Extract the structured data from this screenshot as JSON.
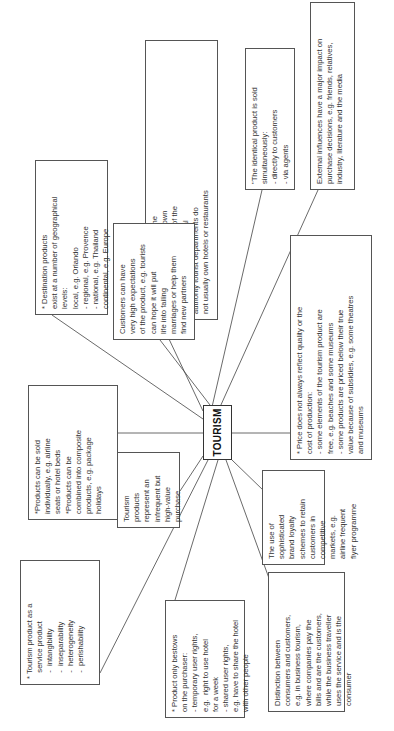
{
  "diagram": {
    "center": {
      "label": "TOURISM"
    },
    "nodes": [
      {
        "id": "organizations",
        "text": "*Organizations marketing the\ndestination product do not own\nor control all the elements of the\nproduct.  For example, local\nauthority tourist departments do\nnot usually own hotels or restaurants"
      },
      {
        "id": "identical-product",
        "text": "\"The identical product is sold\nsimultaneously:\n- directly to customers\n- via agents"
      },
      {
        "id": "external-influences",
        "text": "External influences have a major impact on\npurchase decisions, e.g. friends, relatives,\nindustry, literature and the media"
      },
      {
        "id": "destination-products",
        "text": "* Destination products\nexist at a number of geographical\nlevels:\nlocal, e.g. Orlando\n- regional, e.g. Provence\n- national, e.g. Thailand\ncontinental, e.g. Europe"
      },
      {
        "id": "high-expectations",
        "text": "Customers can have\nvery high expectations\nof the product, e.g. tourists\ncan hope it will put\nlife into failing\nmarriages or help them\nfind new partners"
      },
      {
        "id": "price",
        "text": "* Price does not always reflect quality or the\ncost of production:\n- some elements of the tourism product are\nfree, e.g. beaches and some museums\n- some products are priced below their true\nvalue because of subsidies, e.g. some theatres\nand museums"
      },
      {
        "id": "products-sold",
        "text": "*Products can be sold\nindividually, e.g. airline\nseats or hotel beds\n*Products can be\ncombined into composite\nproducts, e.g. package\nholidays"
      },
      {
        "id": "infrequent-purchase",
        "text": "Tourism\nproducts\nrepresent an\ninfrequent but\nhigh-value\npurchase"
      },
      {
        "id": "brand-loyalty",
        "text": "The use of\nsophisticated\nbrand loyalty\nschemes to retain\ncustomers in\ncompetitive\nmarkets, e.g.\nairline frequent\nflyer programme"
      },
      {
        "id": "service-product",
        "text": "* Tourism product as a\n   service product\n   -  intangibility\n   -  inseparability\n   -  heterogeneity\n   -  perishability"
      },
      {
        "id": "user-rights",
        "text": "* Product only bestows\non the purchaser:\n- temporary user rights,\ne.g.  right to use hotel\nfor a week\n- shared user rights,\ne.g. have to share the hotel\nwith other people"
      },
      {
        "id": "consumers-customers",
        "text": "Distinction between\nconsumers and customers,\ne.g. in business tourism,\nwhere companies pay the\nbills and are the customers,\nwhile the business traveller\nuses the service and is the\nconsumer"
      }
    ]
  }
}
